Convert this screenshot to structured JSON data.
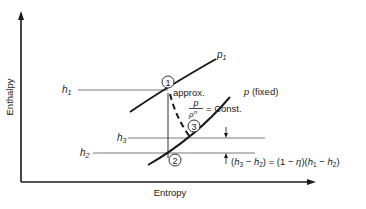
{
  "diagram": {
    "axes": {
      "x_label": "Entropy",
      "y_label": "Enthalpy"
    },
    "levels": {
      "h1": {
        "sym": "h",
        "sub": "1"
      },
      "h2": {
        "sym": "h",
        "sub": "2"
      },
      "h3": {
        "sym": "h",
        "sub": "3"
      }
    },
    "curves": {
      "p1": {
        "sym": "p",
        "sub": "1"
      },
      "p_fixed": {
        "sym": "p",
        "suffix": " (fixed)"
      }
    },
    "points": {
      "p1": "1",
      "p2": "2",
      "p3": "3"
    },
    "annotations": {
      "approx": "approx.",
      "polytropic_num": "p",
      "polytropic_den": "ρ",
      "polytropic_den_exp": "n",
      "polytropic_rhs": "= Const.",
      "efficiency_relation": {
        "lhs_open": "(",
        "h3_sym": "h",
        "h3_sub": "3",
        "minus1": " − ",
        "h2_sym": "h",
        "h2_sub": "2",
        "lhs_close": ") = (1 − ",
        "eta": "η",
        "mid": ")(",
        "h1_sym": "h",
        "h1_sub": "1",
        "minus2": " − ",
        "h2b_sym": "h",
        "h2b_sub": "2",
        "rhs_close": ")"
      }
    },
    "colors": {
      "ink": "#1a1a1a",
      "thin_line": "#555555",
      "background": "#ffffff"
    }
  }
}
